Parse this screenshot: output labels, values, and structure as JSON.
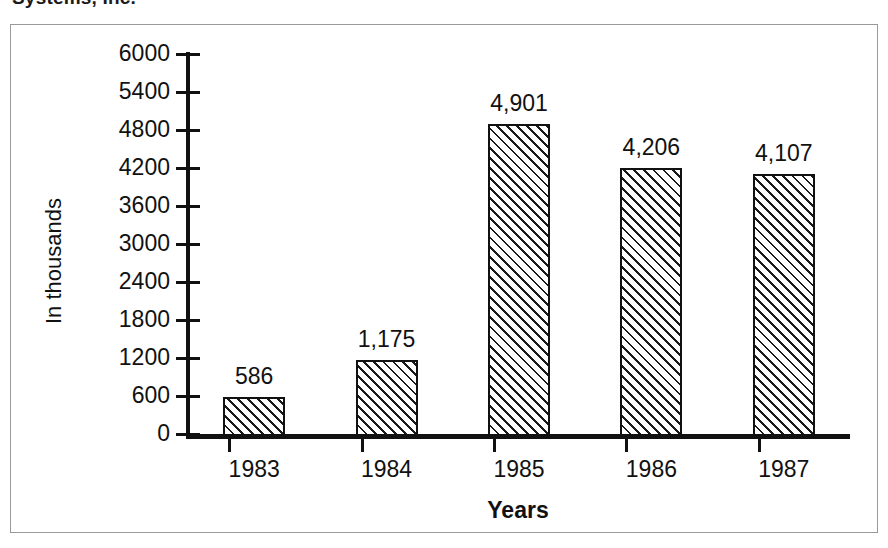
{
  "document": {
    "clipped_title": "Systems, Inc."
  },
  "chart_data": {
    "type": "bar",
    "title": "",
    "xlabel": "Years",
    "ylabel": "In thousands",
    "categories": [
      "1983",
      "1984",
      "1985",
      "1986",
      "1987"
    ],
    "values": [
      586,
      1175,
      4901,
      4206,
      4107
    ],
    "value_labels": [
      "586",
      "1,175",
      "4,901",
      "4,206",
      "4,107"
    ],
    "ylim": [
      0,
      6000
    ],
    "ytick_values": [
      0,
      600,
      1200,
      1800,
      2400,
      3000,
      3600,
      4200,
      4800,
      5400,
      6000
    ],
    "ytick_labels": [
      "0",
      "600",
      "1200",
      "1800",
      "2400",
      "3000",
      "3600",
      "4200",
      "4800",
      "5400",
      "6000"
    ],
    "grid": false,
    "legend": null,
    "bar_fill": "diagonal-hatch",
    "bar_color": "#ffffff",
    "line_color": "#111111"
  }
}
